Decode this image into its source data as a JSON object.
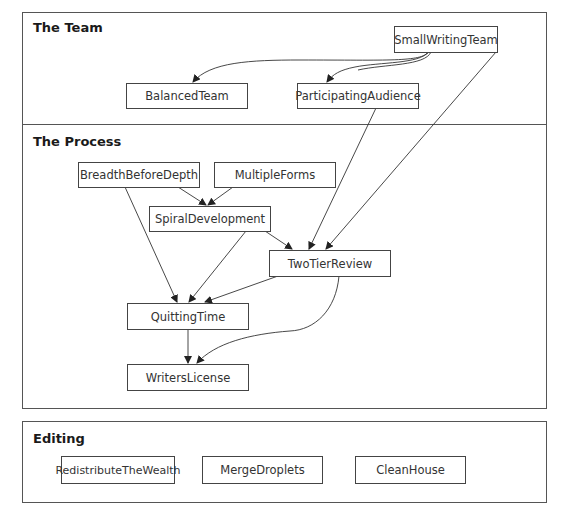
{
  "sections": {
    "team": {
      "title": "The Team"
    },
    "process": {
      "title": "The Process"
    },
    "editing": {
      "title": "Editing"
    }
  },
  "nodes": {
    "small_writing_team": "SmallWritingTeam",
    "balanced_team": "BalancedTeam",
    "participating_audience": "ParticipatingAudience",
    "breadth_before_depth": "BreadthBeforeDepth",
    "multiple_forms": "MultipleForms",
    "spiral_development": "SpiralDevelopment",
    "two_tier_review": "TwoTierReview",
    "quitting_time": "QuittingTime",
    "writers_license": "WritersLicense",
    "redistribute_the_wealth": "RedistributeTheWealth",
    "merge_droplets": "MergeDroplets",
    "clean_house": "CleanHouse"
  },
  "edges": [
    {
      "from": "SmallWritingTeam",
      "to": "BalancedTeam"
    },
    {
      "from": "SmallWritingTeam",
      "to": "ParticipatingAudience"
    },
    {
      "from": "SmallWritingTeam",
      "to": "TwoTierReview"
    },
    {
      "from": "ParticipatingAudience",
      "to": "TwoTierReview"
    },
    {
      "from": "BreadthBeforeDepth",
      "to": "SpiralDevelopment"
    },
    {
      "from": "MultipleForms",
      "to": "SpiralDevelopment"
    },
    {
      "from": "BreadthBeforeDepth",
      "to": "QuittingTime"
    },
    {
      "from": "SpiralDevelopment",
      "to": "QuittingTime"
    },
    {
      "from": "SpiralDevelopment",
      "to": "TwoTierReview"
    },
    {
      "from": "TwoTierReview",
      "to": "QuittingTime"
    },
    {
      "from": "TwoTierReview",
      "to": "WritersLicense"
    },
    {
      "from": "QuittingTime",
      "to": "WritersLicense"
    }
  ]
}
